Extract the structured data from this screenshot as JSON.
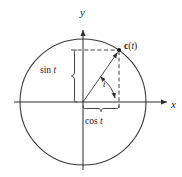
{
  "figure": {
    "type": "diagram",
    "background_color": "#ffffff",
    "stroke_color": "#2b2b2b",
    "text_color": "#1a1a1a",
    "width": 182,
    "height": 177
  },
  "axes": {
    "x_label": "x",
    "y_label": "y",
    "origin": {
      "x": 83,
      "y": 102
    },
    "x_axis": {
      "x1": 14,
      "y1": 102,
      "x2": 170,
      "y2": 102,
      "arrow": "right"
    },
    "y_axis": {
      "x1": 83,
      "y1": 170,
      "x2": 83,
      "y2": 27,
      "arrow": "up"
    }
  },
  "circle": {
    "name": "unit-circle",
    "center_x": 83,
    "center_y": 102,
    "radius": 63
  },
  "point": {
    "label_bold": "c",
    "label_open": "(",
    "label_var": "t",
    "label_close": ")",
    "full_label": "c( t )",
    "x": 119,
    "y": 50
  },
  "radius_line": {
    "name": "radius-vector",
    "from_x": 83,
    "from_y": 102,
    "to_x": 119,
    "to_y": 50
  },
  "dashed_lines": {
    "horizontal": {
      "x1": 72,
      "y1": 50,
      "x2": 119,
      "y2": 50
    },
    "vertical": {
      "x1": 119,
      "y1": 50,
      "x2": 119,
      "y2": 110
    }
  },
  "braces": {
    "sin": {
      "label_fn": "sin",
      "label_var": "t",
      "full_label": "sin t",
      "orientation": "vertical",
      "top_y": 50,
      "bottom_y": 102,
      "x": 73,
      "label_x": 41,
      "label_y": 71
    },
    "cos": {
      "label_fn": "cos",
      "label_var": "t",
      "full_label": "cos t",
      "orientation": "horizontal",
      "left_x": 83,
      "right_x": 119,
      "y": 110,
      "label_x": 85,
      "label_y": 120
    }
  },
  "angle": {
    "label": "t",
    "label_x": 104,
    "label_y": 84,
    "arc_radius": 30,
    "arrow": "from-radius-to-vertical"
  }
}
